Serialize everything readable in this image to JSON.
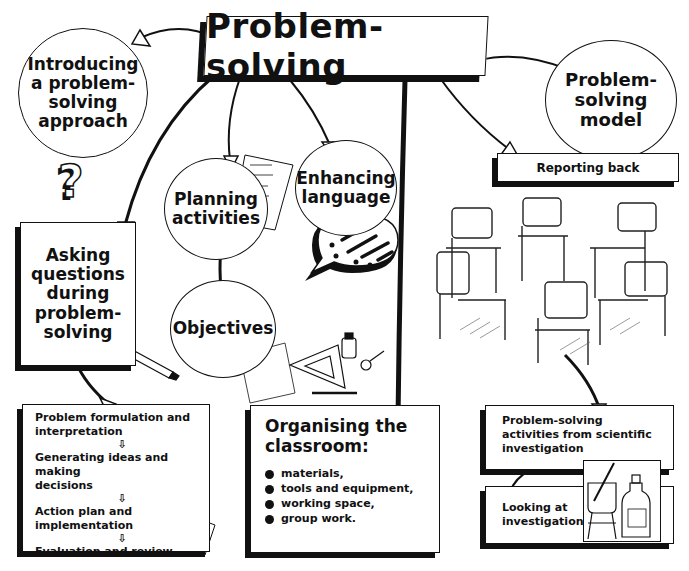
{
  "title": "Problem-solving",
  "nodes": {
    "introducing": "Introducing a problem-solving approach",
    "introducing_lines": [
      "Introducing",
      "a problem-",
      "solving",
      "approach"
    ],
    "model_lines": [
      "Problem-",
      "solving",
      "model"
    ],
    "reporting_back": "Reporting back",
    "asking_lines": [
      "Asking",
      "questions",
      "during",
      "problem-",
      "solving"
    ],
    "planning_lines": [
      "Planning",
      "activities"
    ],
    "enhancing_lines": [
      "Enhancing",
      "language"
    ],
    "objectives": "Objectives"
  },
  "process_box": {
    "steps": [
      [
        "Problem formulation and",
        "interpretation"
      ],
      [
        "Generating ideas and making",
        "decisions"
      ],
      [
        "Action plan and implementation"
      ],
      [
        "Evaluation and review"
      ]
    ],
    "arrow_glyph": "⇩"
  },
  "classroom_box": {
    "title_lines": [
      "Organising the",
      "classroom:"
    ],
    "items": [
      "materials,",
      "tools and equipment,",
      "working space,",
      "group work."
    ]
  },
  "science_box": {
    "activities_lines": [
      "Problem-solving",
      "activities from scientific",
      "investigation"
    ],
    "looking_lines": [
      "Looking at",
      "investigations"
    ]
  },
  "icons": {
    "question_mark": "?"
  }
}
